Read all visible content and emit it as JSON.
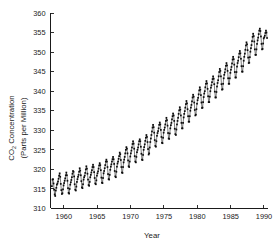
{
  "chart_data": {
    "type": "line",
    "title": "",
    "xlabel": "Year",
    "ylabel": "CO2 Concentration (Parts per Million)",
    "ylabel_line1_prefix": "CO",
    "ylabel_line1_sub": "2",
    "ylabel_line1_suffix": " Concentration",
    "ylabel_line2": "(Parts per Million)",
    "xlim": [
      1958.0,
      1990.6
    ],
    "ylim": [
      310,
      360
    ],
    "xticks": [
      1960,
      1965,
      1970,
      1975,
      1980,
      1985,
      1990
    ],
    "xtick_labels": [
      "1960",
      "1965",
      "1970",
      "1975",
      "1980",
      "1985",
      "1990"
    ],
    "yticks": [
      310,
      315,
      320,
      325,
      330,
      335,
      340,
      345,
      350,
      355,
      360
    ],
    "ytick_labels": [
      "310",
      "315",
      "320",
      "325",
      "330",
      "335",
      "340",
      "345",
      "350",
      "355",
      "360"
    ],
    "grid": false,
    "legend": "none",
    "marker": "filled-dot",
    "line_color": "#111111",
    "marker_color": "#0d0d0d",
    "series": [
      {
        "name": "Mauna Loa monthly mean CO2",
        "x": [
          1958.208,
          1958.292,
          1958.375,
          1958.458,
          1958.542,
          1958.625,
          1958.708,
          1958.792,
          1958.875,
          1958.958,
          1959.042,
          1959.125,
          1959.208,
          1959.292,
          1959.375,
          1959.458,
          1959.542,
          1959.625,
          1959.708,
          1959.792,
          1959.875,
          1959.958,
          1960.042,
          1960.125,
          1960.208,
          1960.292,
          1960.375,
          1960.458,
          1960.542,
          1960.625,
          1960.708,
          1960.792,
          1960.875,
          1960.958,
          1961.042,
          1961.125,
          1961.208,
          1961.292,
          1961.375,
          1961.458,
          1961.542,
          1961.625,
          1961.708,
          1961.792,
          1961.875,
          1961.958,
          1962.042,
          1962.125,
          1962.208,
          1962.292,
          1962.375,
          1962.458,
          1962.542,
          1962.625,
          1962.708,
          1962.792,
          1962.875,
          1962.958,
          1963.042,
          1963.125,
          1963.208,
          1963.292,
          1963.375,
          1963.458,
          1963.542,
          1963.625,
          1963.708,
          1963.792,
          1963.875,
          1963.958,
          1964.042,
          1964.125,
          1964.208,
          1964.292,
          1964.375,
          1964.458,
          1964.542,
          1964.625,
          1964.708,
          1964.792,
          1964.875,
          1964.958,
          1965.042,
          1965.125,
          1965.208,
          1965.292,
          1965.375,
          1965.458,
          1965.542,
          1965.625,
          1965.708,
          1965.792,
          1965.875,
          1965.958,
          1966.042,
          1966.125,
          1966.208,
          1966.292,
          1966.375,
          1966.458,
          1966.542,
          1966.625,
          1966.708,
          1966.792,
          1966.875,
          1966.958,
          1967.042,
          1967.125,
          1967.208,
          1967.292,
          1967.375,
          1967.458,
          1967.542,
          1967.625,
          1967.708,
          1967.792,
          1967.875,
          1967.958,
          1968.042,
          1968.125,
          1968.208,
          1968.292,
          1968.375,
          1968.458,
          1968.542,
          1968.625,
          1968.708,
          1968.792,
          1968.875,
          1968.958,
          1969.042,
          1969.125,
          1969.208,
          1969.292,
          1969.375,
          1969.458,
          1969.542,
          1969.625,
          1969.708,
          1969.792,
          1969.875,
          1969.958,
          1970.042,
          1970.125,
          1970.208,
          1970.292,
          1970.375,
          1970.458,
          1970.542,
          1970.625,
          1970.708,
          1970.792,
          1970.875,
          1970.958,
          1971.042,
          1971.125,
          1971.208,
          1971.292,
          1971.375,
          1971.458,
          1971.542,
          1971.625,
          1971.708,
          1971.792,
          1971.875,
          1971.958,
          1972.042,
          1972.125,
          1972.208,
          1972.292,
          1972.375,
          1972.458,
          1972.542,
          1972.625,
          1972.708,
          1972.792,
          1972.875,
          1972.958,
          1973.042,
          1973.125,
          1973.208,
          1973.292,
          1973.375,
          1973.458,
          1973.542,
          1973.625,
          1973.708,
          1973.792,
          1973.875,
          1973.958,
          1974.042,
          1974.125,
          1974.208,
          1974.292,
          1974.375,
          1974.458,
          1974.542,
          1974.625,
          1974.708,
          1974.792,
          1974.875,
          1974.958,
          1975.042,
          1975.125,
          1975.208,
          1975.292,
          1975.375,
          1975.458,
          1975.542,
          1975.625,
          1975.708,
          1975.792,
          1975.875,
          1975.958,
          1976.042,
          1976.125,
          1976.208,
          1976.292,
          1976.375,
          1976.458,
          1976.542,
          1976.625,
          1976.708,
          1976.792,
          1976.875,
          1976.958,
          1977.042,
          1977.125,
          1977.208,
          1977.292,
          1977.375,
          1977.458,
          1977.542,
          1977.625,
          1977.708,
          1977.792,
          1977.875,
          1977.958,
          1978.042,
          1978.125,
          1978.208,
          1978.292,
          1978.375,
          1978.458,
          1978.542,
          1978.625,
          1978.708,
          1978.792,
          1978.875,
          1978.958,
          1979.042,
          1979.125,
          1979.208,
          1979.292,
          1979.375,
          1979.458,
          1979.542,
          1979.625,
          1979.708,
          1979.792,
          1979.875,
          1979.958,
          1980.042,
          1980.125,
          1980.208,
          1980.292,
          1980.375,
          1980.458,
          1980.542,
          1980.625,
          1980.708,
          1980.792,
          1980.875,
          1980.958,
          1981.042,
          1981.125,
          1981.208,
          1981.292,
          1981.375,
          1981.458,
          1981.542,
          1981.625,
          1981.708,
          1981.792,
          1981.875,
          1981.958,
          1982.042,
          1982.125,
          1982.208,
          1982.292,
          1982.375,
          1982.458,
          1982.542,
          1982.625,
          1982.708,
          1982.792,
          1982.875,
          1982.958,
          1983.042,
          1983.125,
          1983.208,
          1983.292,
          1983.375,
          1983.458,
          1983.542,
          1983.625,
          1983.708,
          1983.792,
          1983.875,
          1983.958,
          1984.042,
          1984.125,
          1984.208,
          1984.292,
          1984.375,
          1984.458,
          1984.542,
          1984.625,
          1984.708,
          1984.792,
          1984.875,
          1984.958,
          1985.042,
          1985.125,
          1985.208,
          1985.292,
          1985.375,
          1985.458,
          1985.542,
          1985.625,
          1985.708,
          1985.792,
          1985.875,
          1985.958,
          1986.042,
          1986.125,
          1986.208,
          1986.292,
          1986.375,
          1986.458,
          1986.542,
          1986.625,
          1986.708,
          1986.792,
          1986.875,
          1986.958,
          1987.042,
          1987.125,
          1987.208,
          1987.292,
          1987.375,
          1987.458,
          1987.542,
          1987.625,
          1987.708,
          1987.792,
          1987.875,
          1987.958,
          1988.042,
          1988.125,
          1988.208,
          1988.292,
          1988.375,
          1988.458,
          1988.542,
          1988.625,
          1988.708,
          1988.792,
          1988.875,
          1988.958,
          1989.042,
          1989.125,
          1989.208,
          1989.292,
          1989.375,
          1989.458,
          1989.542,
          1989.625,
          1989.708,
          1989.792,
          1989.875,
          1989.958,
          1990.042,
          1990.125,
          1990.208,
          1990.292,
          1990.375,
          1990.458
        ],
        "values": [
          315.7,
          317.4,
          317.5,
          316.4,
          314.8,
          313.6,
          313.2,
          314.6,
          315.3,
          316.1,
          316.4,
          316.9,
          317.6,
          318.4,
          319.0,
          318.1,
          316.3,
          314.7,
          313.7,
          313.9,
          314.9,
          315.9,
          316.5,
          317.1,
          317.7,
          318.5,
          319.2,
          318.5,
          317.1,
          315.2,
          314.0,
          313.8,
          315.0,
          316.1,
          316.7,
          317.3,
          318.0,
          318.9,
          319.6,
          319.4,
          318.2,
          316.2,
          314.8,
          314.6,
          315.6,
          316.8,
          317.5,
          318.1,
          318.6,
          319.4,
          320.3,
          319.7,
          318.5,
          317.0,
          315.4,
          315.2,
          316.2,
          317.4,
          318.0,
          318.4,
          319.1,
          320.0,
          320.8,
          320.2,
          318.9,
          317.4,
          316.0,
          315.8,
          316.8,
          318.0,
          318.6,
          319.2,
          319.8,
          320.6,
          321.2,
          320.6,
          319.3,
          317.8,
          316.4,
          316.2,
          317.2,
          318.4,
          319.0,
          319.5,
          320.2,
          321.0,
          321.6,
          321.1,
          319.8,
          317.9,
          316.6,
          316.5,
          317.8,
          319.0,
          319.6,
          320.3,
          321.1,
          322.0,
          322.5,
          322.0,
          320.6,
          318.8,
          317.5,
          317.4,
          318.6,
          319.9,
          320.7,
          321.3,
          322.0,
          322.6,
          323.2,
          322.6,
          321.4,
          319.6,
          318.2,
          318.0,
          319.4,
          320.7,
          321.5,
          322.0,
          322.7,
          323.4,
          324.3,
          323.9,
          322.4,
          320.6,
          319.2,
          319.1,
          320.6,
          321.8,
          322.5,
          323.2,
          324.1,
          325.0,
          325.7,
          325.3,
          324.1,
          322.3,
          320.8,
          320.6,
          322.0,
          323.3,
          324.1,
          324.8,
          325.6,
          326.5,
          327.2,
          326.6,
          325.3,
          323.4,
          322.0,
          321.8,
          323.2,
          324.4,
          325.0,
          325.6,
          326.4,
          327.2,
          327.7,
          327.2,
          325.8,
          324.0,
          322.5,
          322.4,
          323.7,
          325.0,
          325.7,
          326.4,
          327.3,
          328.1,
          328.8,
          328.3,
          327.0,
          325.2,
          323.8,
          324.1,
          325.6,
          327.0,
          327.9,
          328.8,
          329.7,
          330.7,
          331.4,
          330.8,
          329.4,
          327.5,
          326.0,
          325.8,
          327.2,
          328.6,
          329.3,
          329.8,
          330.5,
          331.4,
          332.0,
          331.5,
          330.1,
          328.3,
          326.8,
          326.7,
          328.1,
          329.4,
          330.1,
          330.7,
          331.5,
          332.4,
          333.2,
          332.6,
          331.2,
          329.3,
          327.9,
          327.8,
          329.2,
          330.5,
          331.3,
          331.9,
          332.8,
          333.6,
          334.3,
          333.8,
          332.4,
          330.4,
          329.0,
          328.8,
          330.2,
          331.5,
          332.4,
          333.2,
          334.2,
          335.1,
          335.9,
          335.3,
          333.8,
          331.9,
          330.5,
          330.5,
          331.9,
          333.3,
          334.2,
          334.9,
          335.8,
          336.7,
          337.5,
          336.9,
          335.4,
          333.6,
          332.2,
          332.2,
          333.6,
          335.0,
          335.8,
          336.5,
          337.4,
          338.4,
          339.1,
          338.6,
          337.1,
          335.2,
          333.8,
          334.0,
          335.4,
          336.8,
          337.7,
          338.3,
          339.2,
          340.2,
          341.0,
          340.4,
          339.0,
          337.1,
          335.7,
          335.8,
          337.2,
          338.5,
          339.4,
          340.0,
          341.0,
          341.9,
          342.6,
          342.0,
          340.6,
          338.7,
          337.2,
          337.2,
          338.6,
          340.0,
          340.9,
          341.5,
          342.3,
          343.1,
          343.8,
          343.2,
          341.8,
          339.9,
          338.4,
          338.4,
          339.8,
          341.2,
          342.1,
          342.8,
          343.8,
          344.9,
          345.7,
          345.2,
          343.8,
          341.8,
          340.4,
          340.5,
          341.9,
          343.3,
          344.2,
          344.8,
          345.6,
          346.5,
          347.2,
          346.6,
          345.2,
          343.3,
          341.9,
          341.9,
          343.3,
          344.7,
          345.5,
          346.2,
          347.1,
          348.1,
          348.8,
          348.2,
          346.8,
          344.9,
          343.5,
          343.5,
          344.9,
          346.3,
          347.2,
          347.8,
          348.7,
          349.6,
          350.3,
          349.7,
          348.3,
          346.4,
          345.0,
          345.0,
          346.4,
          347.8,
          348.8,
          349.6,
          350.6,
          351.7,
          352.5,
          352.0,
          350.5,
          348.6,
          347.2,
          347.3,
          348.7,
          350.1,
          351.0,
          351.8,
          352.8,
          353.9,
          354.7,
          354.1,
          352.7,
          350.7,
          349.3,
          349.3,
          350.7,
          352.1,
          353.0,
          353.7,
          354.6,
          355.5,
          356.0,
          355.4,
          354.0,
          352.1,
          350.7,
          350.8,
          352.2,
          353.5,
          353.8,
          354.2,
          354.9,
          355.5,
          355.0,
          353.6
        ]
      }
    ]
  }
}
